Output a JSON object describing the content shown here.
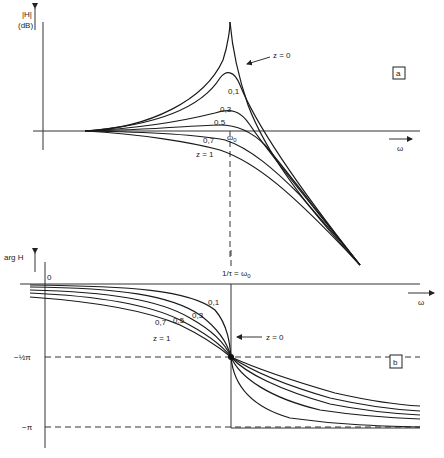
{
  "panel_a": {
    "badge": "a",
    "y_label_1": "|H|",
    "y_label_2": "(dB)",
    "x_label": "ω",
    "marker_label": "ω",
    "marker_sub": "0",
    "curve_labels": {
      "z0": "z = 0",
      "z01": "0,1",
      "z03": "0,3",
      "z05": "0,5",
      "z07": "0,7",
      "z1": "z = 1"
    }
  },
  "panel_b": {
    "badge": "b",
    "y_label": "arg H",
    "x_label": "ω",
    "origin_label": "0",
    "tick_half_pi": "−½π",
    "tick_pi": "−π",
    "marker_label": "1/τ = ω",
    "marker_sub": "0",
    "curve_labels": {
      "z0": "z = 0",
      "z01": "0,1",
      "z03": "0,3",
      "z05": "0,5",
      "z07": "0,7",
      "z1": "z = 1"
    }
  }
}
